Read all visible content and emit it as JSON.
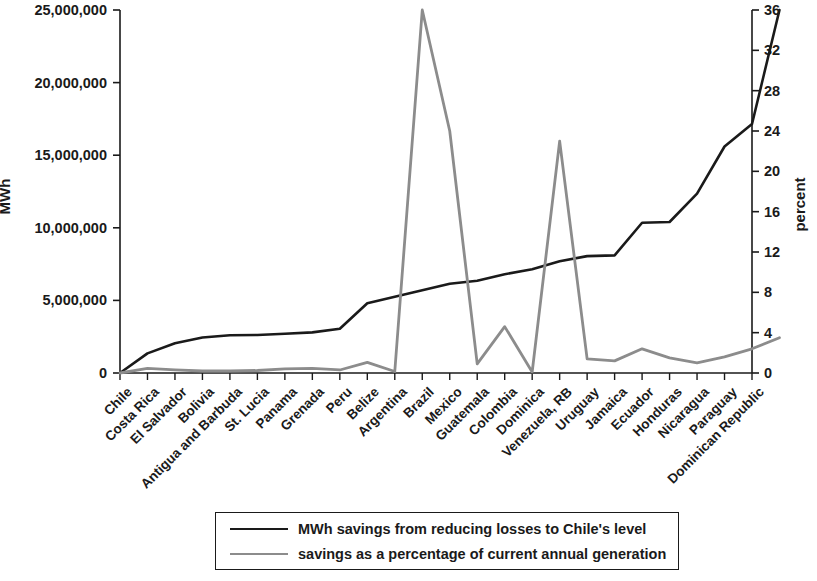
{
  "chart_data": {
    "type": "line",
    "title": "",
    "subtitle": "",
    "xlabel": "",
    "ylabel": "MWh",
    "y2label": "percent",
    "ylim": [
      0,
      25000000
    ],
    "y2lim": [
      0,
      36
    ],
    "yticks": [
      "0",
      "5,000,000",
      "10,000,000",
      "15,000,000",
      "20,000,000",
      "25,000,000"
    ],
    "ytick_values": [
      0,
      5000000,
      10000000,
      15000000,
      20000000,
      25000000
    ],
    "y2ticks": [
      "0",
      "4",
      "8",
      "12",
      "16",
      "20",
      "24",
      "28",
      "32",
      "36"
    ],
    "y2tick_values": [
      0,
      4,
      8,
      12,
      16,
      20,
      24,
      28,
      32,
      36
    ],
    "grid": false,
    "legend_position": "bottom",
    "categories": [
      "Chile",
      "Costa Rica",
      "El Salvador",
      "Bolivia",
      "Antigua and Barbuda",
      "St. Lucia",
      "Panama",
      "Grenada",
      "Peru",
      "Belize",
      "Argentina",
      "Brazil",
      "Mexico",
      "Guatemala",
      "Colombia",
      "Dominica",
      "Venezuela, RB",
      "Uruguay",
      "Jamaica",
      "Ecuador",
      "Honduras",
      "Nicaragua",
      "Paraguay",
      "Dominican Republic"
    ],
    "series": [
      {
        "name": "MWh savings from reducing losses to Chile's level",
        "axis": "left",
        "color": "#1a1a1a",
        "values": [
          0,
          1350000,
          2050000,
          2450000,
          2600000,
          2620000,
          2700000,
          2800000,
          3050000,
          4800000,
          5250000,
          5700000,
          6150000,
          6350000,
          6800000,
          7150000,
          7700000,
          8050000,
          8100000,
          10350000,
          10400000,
          12350000,
          15600000,
          17150000
        ]
      },
      {
        "name": "savings as a percentage of current annual generation",
        "axis": "right",
        "color": "#8c8c8c",
        "values": [
          0,
          0.45,
          0.3,
          0.2,
          0.2,
          0.25,
          0.4,
          0.45,
          0.3,
          1.05,
          0.15,
          36.0,
          24.0,
          0.9,
          4.6,
          0.1,
          23.0,
          1.4,
          1.2,
          2.4,
          1.5,
          1.0,
          1.6,
          2.4
        ]
      }
    ],
    "series_end_note": {
      "left_series_final_value": 25000000,
      "right_series_final_value": 3.5
    }
  },
  "legend": {
    "entries": [
      {
        "label": "MWh savings from reducing losses to Chile's level",
        "color": "#1a1a1a"
      },
      {
        "label": "savings as a percentage of current annual generation",
        "color": "#8c8c8c"
      }
    ]
  },
  "colors": {
    "mwh_line": "#1a1a1a",
    "percent_line": "#8c8c8c",
    "axis": "#1a1a1a",
    "background": "#ffffff"
  }
}
